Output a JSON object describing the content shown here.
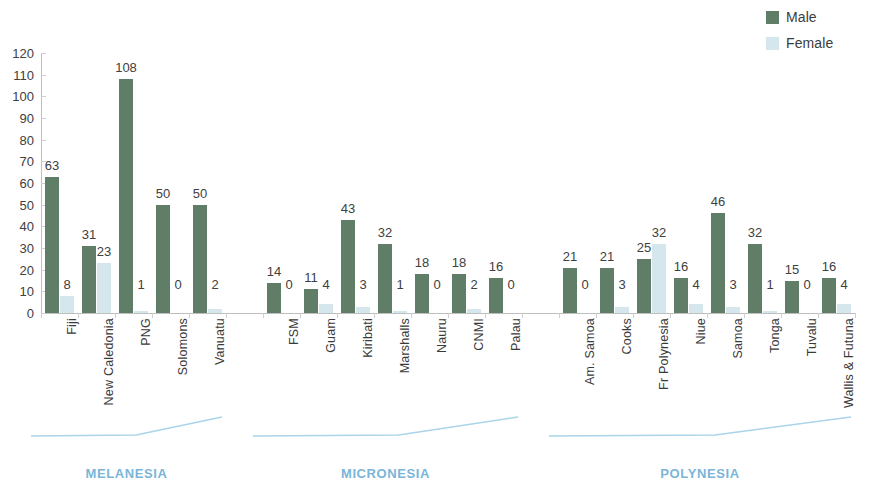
{
  "legend": {
    "position": "top-right",
    "items": [
      {
        "label": "Male",
        "color": "#5f7d67"
      },
      {
        "label": "Female",
        "color": "#d5e7ec"
      }
    ]
  },
  "axes": {
    "y_ticks": [
      "120",
      "110",
      "100",
      "90",
      "80",
      "70",
      "60",
      "50",
      "40",
      "30",
      "20",
      "10",
      "0"
    ],
    "y_min": 0,
    "y_max": 120,
    "y_step": 10
  },
  "regions": [
    {
      "name": "MELANESIA",
      "first": 0,
      "last": 4
    },
    {
      "name": "MICRONESIA",
      "first": 5,
      "last": 11
    },
    {
      "name": "POLYNESIA",
      "first": 12,
      "last": 19
    }
  ],
  "chart_data": {
    "type": "bar",
    "title": "",
    "subtitle": "",
    "xlabel": "",
    "ylabel": "",
    "ylim": [
      0,
      120
    ],
    "ystep": 10,
    "grid": false,
    "legend_position": "top-right",
    "categories": [
      "Fiji",
      "New Caledonia",
      "PNG",
      "Solomons",
      "Vanuatu",
      "FSM",
      "Guam",
      "Kiribati",
      "Marshalls",
      "Nauru",
      "CNMI",
      "Palau",
      "Am. Samoa",
      "Cooks",
      "Fr Polynesia",
      "Niue",
      "Samoa",
      "Tonga",
      "Tuvalu",
      "Wallis & Futuna"
    ],
    "groups": [
      "MELANESIA",
      "MELANESIA",
      "MELANESIA",
      "MELANESIA",
      "MELANESIA",
      "MICRONESIA",
      "MICRONESIA",
      "MICRONESIA",
      "MICRONESIA",
      "MICRONESIA",
      "MICRONESIA",
      "MICRONESIA",
      "POLYNESIA",
      "POLYNESIA",
      "POLYNESIA",
      "POLYNESIA",
      "POLYNESIA",
      "POLYNESIA",
      "POLYNESIA",
      "POLYNESIA"
    ],
    "series": [
      {
        "name": "Male",
        "color": "#5f7d67",
        "values": [
          63,
          31,
          108,
          50,
          50,
          14,
          11,
          43,
          32,
          18,
          18,
          16,
          21,
          21,
          25,
          16,
          46,
          32,
          15,
          16
        ]
      },
      {
        "name": "Female",
        "color": "#d5e7ec",
        "values": [
          8,
          23,
          1,
          0,
          2,
          0,
          4,
          3,
          1,
          0,
          2,
          0,
          0,
          3,
          32,
          4,
          3,
          1,
          0,
          4
        ]
      }
    ]
  }
}
